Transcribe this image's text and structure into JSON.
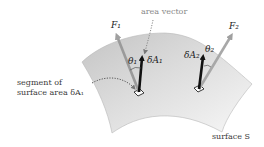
{
  "diagram": {
    "title": "",
    "labels": {
      "area_vector": "area vector",
      "segment_line1": "segment of",
      "segment_line2": "surface area δA₁",
      "surface": "surface S",
      "force1": "F₁",
      "force2": "F₂",
      "area1": "δA₁",
      "area2": "δA₂",
      "theta1": "θ₁",
      "theta2": "θ₂"
    },
    "nodes": [
      {
        "id": "surface-S",
        "kind": "curved surface",
        "label": "surface S"
      },
      {
        "id": "patch-1",
        "kind": "surface element",
        "label": "δA₁"
      },
      {
        "id": "patch-2",
        "kind": "surface element",
        "label": "δA₂"
      }
    ],
    "vectors": [
      {
        "id": "F1",
        "label": "F₁",
        "color": "#9a9a9a",
        "from": "patch-1",
        "direction": "up-left"
      },
      {
        "id": "dA1",
        "label": "δA₁",
        "color": "#111111",
        "from": "patch-1",
        "direction": "up (normal)"
      },
      {
        "id": "F2",
        "label": "F₂",
        "color": "#a8a8a8",
        "from": "patch-2",
        "direction": "up-right"
      },
      {
        "id": "dA2",
        "label": "δA₂",
        "color": "#111111",
        "from": "patch-2",
        "direction": "up (normal)"
      }
    ],
    "angles": [
      {
        "label": "θ₁",
        "between": [
          "F1",
          "dA1"
        ]
      },
      {
        "label": "θ₂",
        "between": [
          "F2",
          "dA2"
        ]
      }
    ],
    "annotations": [
      {
        "text": "area vector",
        "points_to": "dA1",
        "style": "dotted arrow"
      },
      {
        "text": "segment of surface area δA₁",
        "points_to": "patch-1",
        "style": "dotted arrow"
      }
    ],
    "colors": {
      "surface_light": "#f2f2f2",
      "surface_dark": "#c9c9c9",
      "normal_vector": "#111111",
      "force_vector": "#a0a0a0",
      "text": "#3a3a3a"
    }
  }
}
